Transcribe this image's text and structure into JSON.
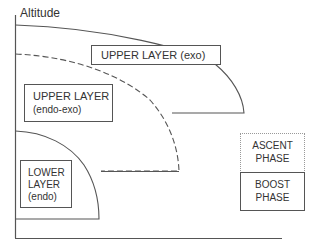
{
  "diagram": {
    "y_axis_label": "Altitude",
    "regions": [
      {
        "id": "upper-exo",
        "line1": "UPPER LAYER (exo)",
        "line2": "",
        "boundary": "solid"
      },
      {
        "id": "upper-endo-exo",
        "line1": "UPPER LAYER",
        "line2": "(endo-exo)",
        "boundary": "dashed"
      },
      {
        "id": "lower-endo",
        "line1": "LOWER",
        "line2": "LAYER",
        "line3": "(endo)",
        "boundary": "solid"
      }
    ],
    "phases": [
      {
        "id": "ascent",
        "line1": "ASCENT",
        "line2": "PHASE",
        "border": "dotted"
      },
      {
        "id": "boost",
        "line1": "BOOST",
        "line2": "PHASE",
        "border": "solid"
      }
    ],
    "colors": {
      "line": "#555555",
      "text": "#333333",
      "dotted_border": "#999999"
    }
  }
}
